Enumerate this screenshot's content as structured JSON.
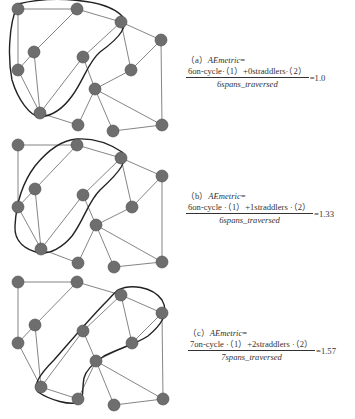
{
  "panels": [
    {
      "id": "a",
      "label": "（a）",
      "metric_name": "AEmetric",
      "equals": "=",
      "numerator": "6on-cycle·（1）+0straddlers·（2）",
      "denominator": "6spans_traversed",
      "result": "=1.0"
    },
    {
      "id": "b",
      "label": "（b）",
      "metric_name": "AEmetric",
      "equals": "=",
      "numerator": "6on-cycle ·（1）+1straddlers ·（2）",
      "denominator": "6spans_traversed",
      "result": "=1.33"
    },
    {
      "id": "c",
      "label": "（c）",
      "metric_name": "AEmetric",
      "equals": "=",
      "numerator": "7on-cycle ·（1）+2straddlers ·（2）",
      "denominator": "7spans_traversed",
      "result": "=1.57"
    }
  ],
  "graph": {
    "nodes": [
      "A",
      "B",
      "C",
      "D",
      "E",
      "F",
      "G",
      "H",
      "I",
      "J",
      "K",
      "L",
      "M"
    ],
    "edges": [
      [
        "A",
        "B"
      ],
      [
        "B",
        "C"
      ],
      [
        "A",
        "G"
      ],
      [
        "B",
        "E"
      ],
      [
        "E",
        "G"
      ],
      [
        "E",
        "J"
      ],
      [
        "G",
        "J"
      ],
      [
        "J",
        "F"
      ],
      [
        "F",
        "C"
      ],
      [
        "C",
        "H"
      ],
      [
        "C",
        "D"
      ],
      [
        "D",
        "H"
      ],
      [
        "D",
        "M"
      ],
      [
        "F",
        "I"
      ],
      [
        "H",
        "I"
      ],
      [
        "I",
        "K"
      ],
      [
        "I",
        "L"
      ],
      [
        "I",
        "M"
      ],
      [
        "J",
        "K"
      ],
      [
        "L",
        "M"
      ]
    ],
    "cycles": {
      "a": [
        "A",
        "C",
        "F",
        "J",
        "G"
      ],
      "b": [
        "G",
        "B",
        "C",
        "F",
        "J"
      ],
      "c": [
        "J",
        "F",
        "C",
        "D",
        "H",
        "I",
        "K"
      ]
    }
  },
  "colors": {
    "node_fill": "#6e6e6e",
    "edge": "#666666",
    "cycle_outline": "#222222"
  }
}
